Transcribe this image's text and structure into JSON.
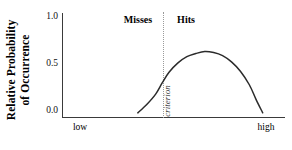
{
  "chart_data": {
    "type": "line",
    "title": "",
    "subtitle": "",
    "xlabel": "",
    "ylabel": "Relative Probability of Occurrence",
    "ylabel_lines": [
      "Relative Probability",
      "of Occurrence"
    ],
    "ylim": [
      0.0,
      1.0
    ],
    "y_ticks": [
      "1.0",
      "0.5",
      "0.0"
    ],
    "y_tick_values": [
      1.0,
      0.5,
      0.0
    ],
    "x_ticks": [
      "low",
      "high"
    ],
    "x_axis_range_labels": {
      "min": "low",
      "max": "high"
    },
    "grid": false,
    "legend": "none",
    "series": [
      {
        "name": "signal distribution",
        "x": [
          0.34,
          0.38,
          0.42,
          0.45,
          0.48,
          0.52,
          0.56,
          0.6,
          0.64,
          0.68,
          0.72,
          0.76,
          0.8,
          0.84,
          0.87,
          0.9
        ],
        "values": [
          0.04,
          0.12,
          0.22,
          0.33,
          0.43,
          0.52,
          0.58,
          0.61,
          0.63,
          0.62,
          0.59,
          0.53,
          0.44,
          0.31,
          0.17,
          0.04
        ]
      }
    ],
    "peak_value": 0.63,
    "annotations": [
      {
        "name": "criterion",
        "text": "criterion",
        "orientation": "vertical",
        "style": "italic",
        "line": "dotted"
      },
      {
        "name": "misses",
        "text": "Misses",
        "side": "left-of-criterion",
        "style": "bold"
      },
      {
        "name": "hits",
        "text": "Hits",
        "side": "right-of-criterion",
        "style": "bold"
      }
    ],
    "colors": {
      "curve": "#2b2b2b",
      "axis": "#3a3a3a",
      "criterion": "#9a9a9a",
      "text": "#000000",
      "background": "#ffffff"
    }
  },
  "axes": {
    "y_title_line1": "Relative Probability",
    "y_title_line2": "of Occurrence",
    "y_tick_top": "1.0",
    "y_tick_mid": "0.5",
    "y_tick_bottom": "0.0",
    "x_low": "low",
    "x_high": "high"
  },
  "annotations": {
    "misses": "Misses",
    "hits": "Hits",
    "criterion": "criterion"
  }
}
